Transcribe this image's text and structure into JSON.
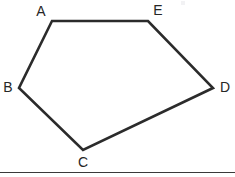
{
  "figure": {
    "name": "pentagon-abcde",
    "shape_type": "pentagon",
    "vertex_count": 5,
    "canvas": {
      "width": 235,
      "height": 177
    },
    "stroke_color": "#2b2b2b",
    "stroke_width": 2.6,
    "label_color": "#262626",
    "background_color": "#ffffff",
    "vertices": [
      {
        "id": "A",
        "label": "A",
        "x": 52,
        "y": 21,
        "label_x": 41,
        "label_y": 12
      },
      {
        "id": "B",
        "label": "B",
        "x": 19,
        "y": 88,
        "label_x": 8,
        "label_y": 88
      },
      {
        "id": "C",
        "label": "C",
        "x": 83,
        "y": 150,
        "label_x": 83,
        "label_y": 163
      },
      {
        "id": "D",
        "label": "D",
        "x": 213,
        "y": 88,
        "label_x": 225,
        "label_y": 88
      },
      {
        "id": "E",
        "label": "E",
        "x": 148,
        "y": 21,
        "label_x": 158,
        "label_y": 11
      }
    ],
    "edges": [
      {
        "from": "A",
        "to": "E"
      },
      {
        "from": "E",
        "to": "D"
      },
      {
        "from": "D",
        "to": "C"
      },
      {
        "from": "C",
        "to": "B"
      },
      {
        "from": "B",
        "to": "A"
      }
    ],
    "polygon_points": "52,21 148,21 213,88 83,150 19,88",
    "baseline": {
      "x1": 0,
      "y1": 172.5,
      "x2": 235,
      "y2": 172.5,
      "color": "#3a3a3a"
    }
  }
}
